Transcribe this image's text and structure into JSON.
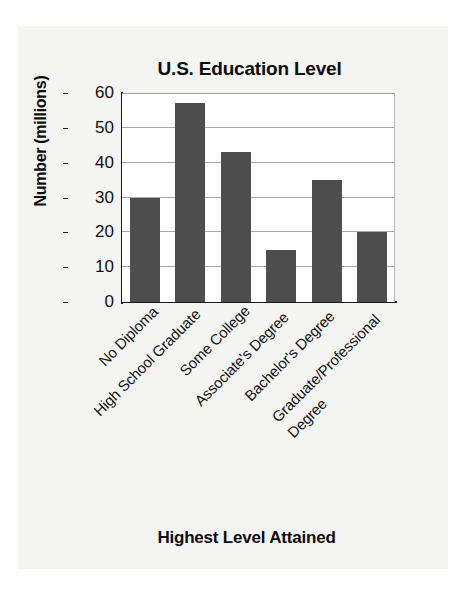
{
  "chart_data": {
    "type": "bar",
    "title": "U.S. Education Level",
    "xlabel": "Highest Level Attained",
    "ylabel": "Number (millions)",
    "categories": [
      "No Diploma",
      "High School Graduate",
      "Some College",
      "Associate's Degree",
      "Bachelor's Degree",
      "Graduate/Professional\nDegree"
    ],
    "values": [
      30,
      57,
      43,
      15,
      35,
      20
    ],
    "ylim": [
      0,
      60
    ],
    "yticks": [
      0,
      10,
      20,
      30,
      40,
      50,
      60
    ],
    "ytick_labels": [
      "0",
      "10",
      "20",
      "30",
      "40",
      "50",
      "60"
    ],
    "grid": true,
    "legend": false,
    "bar_color": "#4d4d4d",
    "plot_background": "#ffffff",
    "gridline_color": "#a9a9a9",
    "axis_color": "#1a1a1a",
    "page_background": "#f4f4f2"
  }
}
